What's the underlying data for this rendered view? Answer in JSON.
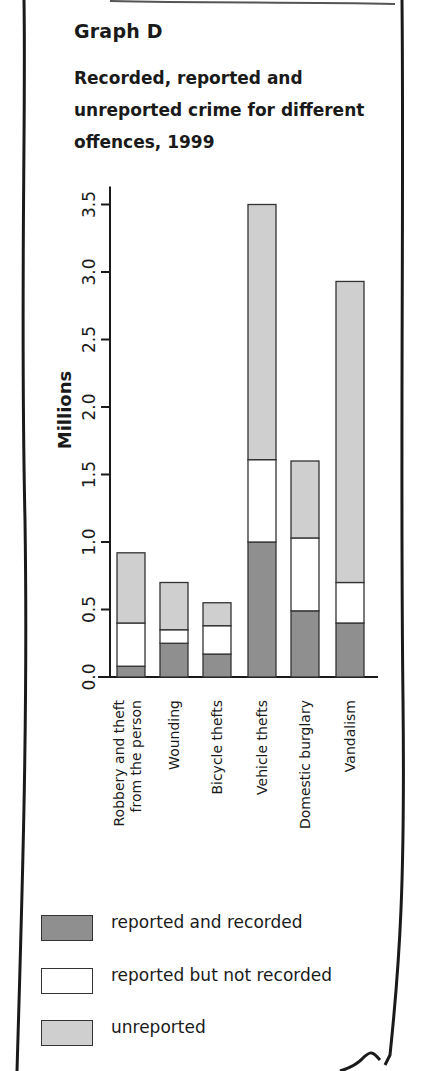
{
  "header": {
    "title": "Graph D",
    "subtitle": "Recorded, reported and unreported crime for different offences, 1999"
  },
  "colors": {
    "reported_and_recorded": "#8f8f8f",
    "reported_not_recorded": "#ffffff",
    "unreported": "#cfcfcf",
    "axis": "#1a1a1a"
  },
  "legend": [
    {
      "label": "reported and recorded",
      "color": "#8f8f8f"
    },
    {
      "label": "reported but not recorded",
      "color": "#ffffff"
    },
    {
      "label": "unreported",
      "color": "#cfcfcf"
    }
  ],
  "chart_data": {
    "type": "bar",
    "stacked": true,
    "title": "Graph D",
    "subtitle": "Recorded, reported and unreported crime for different offences, 1999",
    "xlabel": "",
    "ylabel": "Millions",
    "ylim": [
      0,
      3.5
    ],
    "yticks": [
      0.0,
      0.5,
      1.0,
      1.5,
      2.0,
      2.5,
      3.0,
      3.5
    ],
    "ytick_labels": [
      "0.0",
      "0.5",
      "1.0",
      "1.5",
      "2.0",
      "2.5",
      "3.0",
      "3.5"
    ],
    "grid": false,
    "legend_position": "bottom",
    "categories": [
      "Robbery and theft from the person",
      "Wounding",
      "Bicycle thefts",
      "Vehicle thefts",
      "Domestic burglary",
      "Vandalism"
    ],
    "category_label_lines": [
      [
        "Robbery and theft",
        "from the person"
      ],
      [
        "Wounding"
      ],
      [
        "Bicycle thefts"
      ],
      [
        "Vehicle thefts"
      ],
      [
        "Domestic burglary"
      ],
      [
        "Vandalism"
      ]
    ],
    "series": [
      {
        "name": "reported and recorded",
        "values": [
          0.08,
          0.25,
          0.17,
          1.0,
          0.49,
          0.4
        ]
      },
      {
        "name": "reported but not recorded",
        "values": [
          0.32,
          0.1,
          0.21,
          0.61,
          0.54,
          0.3
        ]
      },
      {
        "name": "unreported",
        "values": [
          0.52,
          0.35,
          0.17,
          1.89,
          0.57,
          2.23
        ]
      }
    ],
    "totals": [
      0.92,
      0.7,
      0.55,
      3.5,
      1.6,
      2.93
    ]
  }
}
